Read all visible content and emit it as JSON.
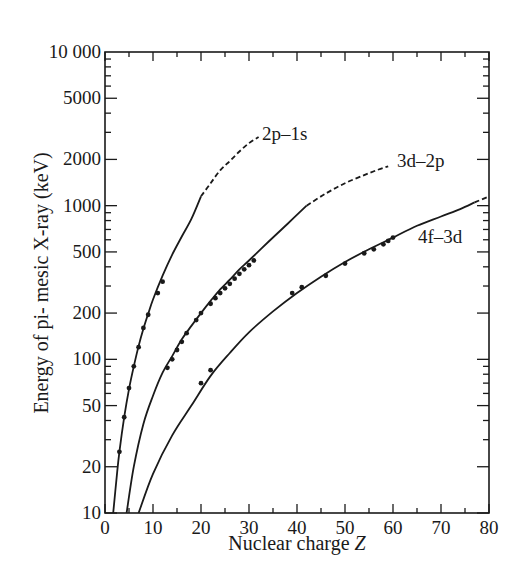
{
  "chart_data": {
    "type": "line",
    "title": "",
    "xlabel": "Nuclear charge Z",
    "xlabel_italic_part": "Z",
    "ylabel": "Energy of pi- mesic X-ray (keV)",
    "xlim": [
      0,
      80
    ],
    "ylim": [
      10,
      10000
    ],
    "yscale": "log",
    "grid": false,
    "legend": "inline labels at curve ends",
    "x_ticks": [
      0,
      10,
      20,
      30,
      40,
      50,
      60,
      70,
      80
    ],
    "x_tick_labels": [
      "0",
      "10",
      "20",
      "30",
      "40",
      "50",
      "60",
      "70",
      "80"
    ],
    "y_ticks": [
      10,
      20,
      50,
      100,
      200,
      500,
      1000,
      2000,
      5000,
      10000
    ],
    "y_tick_labels": [
      "10",
      "20",
      "50",
      "100",
      "200",
      "500",
      "1000",
      "2000",
      "5000",
      "10 000"
    ],
    "series": [
      {
        "name": "2p–1s",
        "label": "2p–1s",
        "curve_solid": [
          [
            1.7,
            10
          ],
          [
            2.5,
            18
          ],
          [
            3,
            25
          ],
          [
            4,
            42
          ],
          [
            5,
            64
          ],
          [
            6,
            90
          ],
          [
            7,
            122
          ],
          [
            8,
            158
          ],
          [
            9,
            198
          ],
          [
            10,
            245
          ],
          [
            12,
            350
          ],
          [
            14,
            480
          ],
          [
            16,
            630
          ],
          [
            18,
            820
          ],
          [
            20,
            1150
          ]
        ],
        "curve_dashed": [
          [
            20,
            1150
          ],
          [
            22,
            1400
          ],
          [
            24,
            1700
          ],
          [
            26,
            1950
          ],
          [
            28,
            2250
          ],
          [
            30,
            2550
          ],
          [
            32,
            2800
          ]
        ],
        "points": [
          [
            3,
            25
          ],
          [
            4,
            42
          ],
          [
            5,
            65
          ],
          [
            6,
            90
          ],
          [
            7,
            120
          ],
          [
            8,
            160
          ],
          [
            9,
            195
          ],
          [
            11,
            270
          ],
          [
            12,
            320
          ]
        ]
      },
      {
        "name": "3d–2p",
        "label": "3d–2p",
        "curve_solid": [
          [
            4.5,
            10
          ],
          [
            6,
            20
          ],
          [
            8,
            38
          ],
          [
            10,
            58
          ],
          [
            12,
            82
          ],
          [
            14,
            105
          ],
          [
            16,
            135
          ],
          [
            18,
            165
          ],
          [
            20,
            200
          ],
          [
            22,
            240
          ],
          [
            24,
            285
          ],
          [
            26,
            330
          ],
          [
            28,
            385
          ],
          [
            30,
            440
          ],
          [
            34,
            580
          ],
          [
            38,
            760
          ],
          [
            42,
            1000
          ]
        ],
        "curve_dashed": [
          [
            42,
            1000
          ],
          [
            46,
            1200
          ],
          [
            50,
            1400
          ],
          [
            54,
            1580
          ],
          [
            57,
            1720
          ],
          [
            59,
            1800
          ]
        ],
        "points": [
          [
            13,
            88
          ],
          [
            14,
            100
          ],
          [
            15,
            115
          ],
          [
            16,
            130
          ],
          [
            17,
            148
          ],
          [
            19,
            180
          ],
          [
            20,
            200
          ],
          [
            22,
            230
          ],
          [
            23,
            250
          ],
          [
            24,
            270
          ],
          [
            25,
            290
          ],
          [
            26,
            310
          ],
          [
            27,
            335
          ],
          [
            28,
            360
          ],
          [
            29,
            385
          ],
          [
            30,
            410
          ],
          [
            31,
            440
          ]
        ]
      },
      {
        "name": "4f–3d",
        "label": "4f–3d",
        "curve_solid": [
          [
            7,
            10
          ],
          [
            10,
            18
          ],
          [
            14,
            32
          ],
          [
            18,
            50
          ],
          [
            22,
            78
          ],
          [
            26,
            110
          ],
          [
            30,
            150
          ],
          [
            35,
            205
          ],
          [
            40,
            270
          ],
          [
            45,
            345
          ],
          [
            50,
            430
          ],
          [
            55,
            520
          ],
          [
            60,
            620
          ],
          [
            65,
            740
          ],
          [
            70,
            850
          ],
          [
            74,
            950
          ],
          [
            77,
            1050
          ]
        ],
        "curve_dashed": [
          [
            77,
            1050
          ],
          [
            80,
            1150
          ]
        ],
        "points": [
          [
            20,
            70
          ],
          [
            22,
            85
          ],
          [
            39,
            270
          ],
          [
            41,
            295
          ],
          [
            46,
            350
          ],
          [
            50,
            420
          ],
          [
            54,
            490
          ],
          [
            56,
            520
          ],
          [
            58,
            560
          ],
          [
            59,
            590
          ],
          [
            60,
            620
          ]
        ]
      }
    ]
  },
  "labels": {
    "series_2p1s": "2p–1s",
    "series_3d2p": "3d–2p",
    "series_4f3d": "4f–3d",
    "x_axis_title": "Nuclear charge ",
    "x_axis_var": "Z",
    "y_axis_title": "Energy of pi- mesic X-ray (keV)"
  },
  "colors": {
    "ink": "#1a1a1a",
    "background": "#ffffff"
  }
}
